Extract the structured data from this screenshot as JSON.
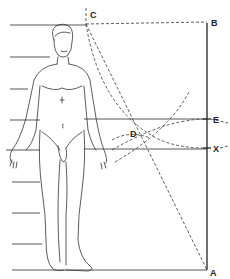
{
  "diagram": {
    "type": "human-proportion-construction",
    "points": {
      "A": {
        "label": "A",
        "x": 207,
        "y": 270
      },
      "B": {
        "label": "B",
        "x": 207,
        "y": 23
      },
      "C": {
        "label": "C",
        "x": 86,
        "y": 23
      },
      "D": {
        "label": "D",
        "x": 138,
        "y": 130
      },
      "E": {
        "label": "E",
        "x": 207,
        "y": 119
      },
      "X": {
        "label": "X",
        "x": 207,
        "y": 148
      }
    },
    "head_lines_y": [
      25,
      57,
      89,
      120,
      150,
      182,
      213,
      244,
      270
    ],
    "colors": {
      "ink": "#333333",
      "background": "#ffffff"
    }
  }
}
